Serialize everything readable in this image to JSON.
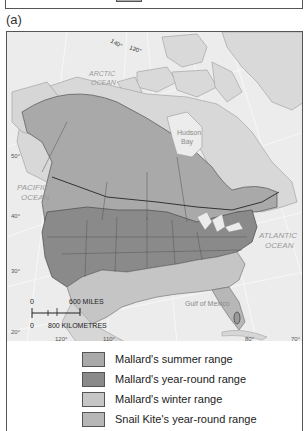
{
  "panel": {
    "label": "(a)"
  },
  "map": {
    "labels": {
      "arctic_ocean_1": "ARCTIC",
      "arctic_ocean_2": "OCEAN",
      "pacific_ocean_1": "PACIFIC",
      "pacific_ocean_2": "OCEAN",
      "atlantic_ocean_1": "ATLANTIC",
      "atlantic_ocean_2": "OCEAN",
      "hudson_bay_1": "Hudson",
      "hudson_bay_2": "Bay",
      "gulf_of_mexico": "Gulf of Mexico"
    },
    "longitude_ticks": {
      "lon_140": "140°",
      "lon_120_top": "120°",
      "lon_120": "120°",
      "lon_110": "110°",
      "lon_80": "80°",
      "lon_70": "70°"
    },
    "latitude_ticks": {
      "lat_50": "50°",
      "lat_40": "40°",
      "lat_30": "30°",
      "lat_20": "20°"
    },
    "scale_bar": {
      "miles_zero": "0",
      "miles_label": "600 MILES",
      "km_zero": "0",
      "km_label": "800 KILOMETRES"
    },
    "colors": {
      "ocean": "#ececec",
      "land": "#d8d8d8",
      "summer_range": "#a8a8a8",
      "year_round_range": "#8a8a8a",
      "winter_range": "#c4c4c4",
      "snail_kite_range": "#b8b8b8",
      "borders": "#555555"
    }
  },
  "legend": {
    "items": [
      {
        "label": "Mallard's summer range",
        "color": "#a9a9a9"
      },
      {
        "label": "Mallard's year-round range",
        "color": "#8a8a8a"
      },
      {
        "label": "Mallard's winter range",
        "color": "#c6c6c6"
      },
      {
        "label": "Snail Kite's year-round range",
        "color": "#b7b7b7"
      }
    ]
  }
}
